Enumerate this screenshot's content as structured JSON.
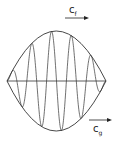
{
  "diagram": {
    "labels": {
      "phase_velocity": "c",
      "phase_velocity_sub": "f",
      "group_velocity": "c",
      "group_velocity_sub": "g"
    },
    "colors": {
      "stroke": "#333333",
      "background": "#ffffff"
    },
    "envelope": {
      "left_x": 7,
      "right_x": 106,
      "center_y": 81,
      "amplitude": 50
    },
    "carrier_cycles": 5
  }
}
